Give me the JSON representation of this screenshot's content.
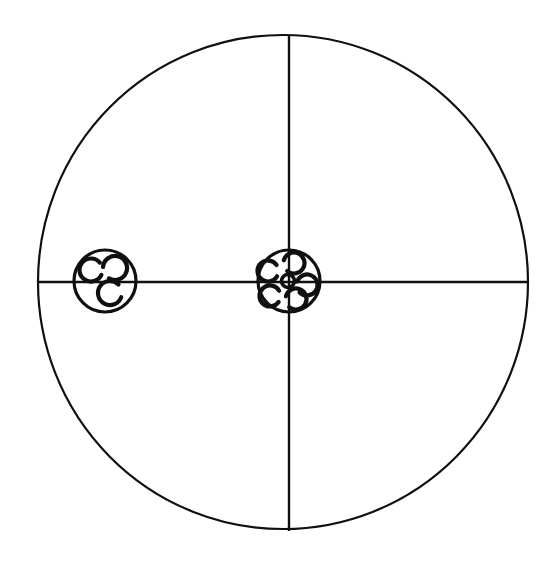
{
  "figure": {
    "name": "circular-cross-section-diagram",
    "kind": "line-drawing",
    "canvas": {
      "width": 558,
      "height": 567
    },
    "background_color": "#ffffff",
    "ink_color": "#101010",
    "caption": "",
    "title": ""
  },
  "main_circle": {
    "label": "outer boundary circle",
    "center_x": 283,
    "center_y": 282,
    "radius_x": 245,
    "radius_y": 247,
    "stroke_width": 2.2,
    "stroke_color": "#101010",
    "fill": "none"
  },
  "axes": [
    {
      "label": "horizontal diameter",
      "name": "horizontal-axis-line",
      "x1": 38,
      "y1": 282,
      "x2": 528,
      "y2": 282,
      "stroke_width": 2.4,
      "stroke_color": "#101010"
    },
    {
      "label": "vertical diameter",
      "name": "vertical-axis-line",
      "x1": 289,
      "y1": 36,
      "x2": 289,
      "y2": 531,
      "stroke_width": 2.4,
      "stroke_color": "#101010"
    }
  ],
  "clusters": [
    {
      "id": "left-cluster",
      "label": "left cluster",
      "center_x": 105,
      "center_y": 281,
      "radius": 31,
      "stroke_width": 3.2,
      "ringlet_count": 3,
      "ringlets": [
        {
          "id": "left-ringlet-upper-left",
          "cx": 91,
          "cy": 270,
          "r": 11.5,
          "stroke_width": 4.2,
          "gap_start_deg": -40,
          "gap_end_deg": 25
        },
        {
          "id": "left-ringlet-upper-right",
          "cx": 115,
          "cy": 268,
          "r": 12.0,
          "stroke_width": 4.2,
          "gap_start_deg": 120,
          "gap_end_deg": 185
        },
        {
          "id": "left-ringlet-lower",
          "cx": 110,
          "cy": 293,
          "r": 12.0,
          "stroke_width": 4.2,
          "gap_start_deg": -45,
          "gap_end_deg": 20
        }
      ]
    },
    {
      "id": "center-cluster",
      "label": "central cluster",
      "center_x": 289,
      "center_y": 281,
      "radius": 31,
      "stroke_width": 3.2,
      "ringlet_count": 5,
      "ringlets": [
        {
          "id": "center-ringlet-top",
          "cx": 294,
          "cy": 263,
          "r": 10.5,
          "stroke_width": 4.2,
          "gap_start_deg": 130,
          "gap_end_deg": 195
        },
        {
          "id": "center-ringlet-left",
          "cx": 268,
          "cy": 271,
          "r": 10.5,
          "stroke_width": 4.2,
          "gap_start_deg": -35,
          "gap_end_deg": 30
        },
        {
          "id": "center-ringlet-right",
          "cx": 307,
          "cy": 285,
          "r": 10.5,
          "stroke_width": 4.2,
          "gap_start_deg": 135,
          "gap_end_deg": 200
        },
        {
          "id": "center-ringlet-lower-left",
          "cx": 270,
          "cy": 296,
          "r": 10.5,
          "stroke_width": 4.2,
          "gap_start_deg": -30,
          "gap_end_deg": 35
        },
        {
          "id": "center-ringlet-lower-mid",
          "cx": 296,
          "cy": 299,
          "r": 10.5,
          "stroke_width": 4.2,
          "gap_start_deg": 130,
          "gap_end_deg": 195
        },
        {
          "id": "center-ringlet-core",
          "cx": 288,
          "cy": 281,
          "r": 6.5,
          "stroke_width": 3.6,
          "gap_start_deg": 0,
          "gap_end_deg": 0
        }
      ]
    }
  ],
  "annotations": {
    "labels": [],
    "scale_bar": null,
    "legend": []
  }
}
